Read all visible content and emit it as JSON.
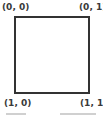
{
  "diagram": {
    "shape": "square",
    "corners": {
      "top_left": "(0, 0)",
      "top_right": "(0, 1)",
      "bottom_left": "(1, 0)",
      "bottom_right": "(1, 1)"
    },
    "colors": {
      "stroke": "#333333",
      "label": "#3a3a3a",
      "background": "#ffffff"
    }
  }
}
